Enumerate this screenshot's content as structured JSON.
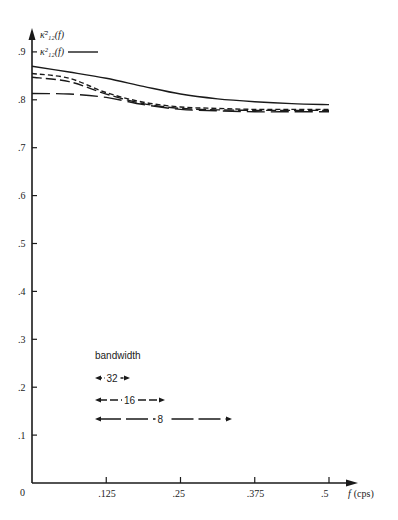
{
  "chart_data": {
    "type": "line",
    "title": "",
    "xlabel": "f (cps)",
    "ylabel": "",
    "xlim": [
      0,
      0.5
    ],
    "ylim": [
      0,
      0.9
    ],
    "grid": false,
    "x_ticks": [
      "0",
      ".125",
      ".25",
      ".375",
      ".5"
    ],
    "y_ticks": [
      ".1",
      ".2",
      ".3",
      ".4",
      ".5",
      ".6",
      ".7",
      ".8",
      ".9"
    ],
    "x": [
      0,
      0.0625,
      0.125,
      0.1875,
      0.25,
      0.3125,
      0.375,
      0.4375,
      0.5
    ],
    "legend": {
      "estimate_label": "κ̄²₁₂(f)",
      "true_label": "κ²₁₂(f)",
      "bandwidth_title": "bandwidth",
      "bandwidth_entries": [
        "32",
        "16",
        "8"
      ]
    },
    "series": [
      {
        "name": "κ²₁₂(f) (true)",
        "style": "solid",
        "values": [
          0.87,
          0.858,
          0.845,
          0.828,
          0.812,
          0.802,
          0.796,
          0.792,
          0.79
        ]
      },
      {
        "name": "κ̄²₁₂(f) bandwidth 32",
        "style": "short-dash",
        "values": [
          0.855,
          0.845,
          0.815,
          0.795,
          0.785,
          0.782,
          0.78,
          0.78,
          0.78
        ]
      },
      {
        "name": "κ̄²₁₂(f) bandwidth 16",
        "style": "medium-dash",
        "values": [
          0.847,
          0.838,
          0.812,
          0.792,
          0.782,
          0.779,
          0.778,
          0.778,
          0.778
        ]
      },
      {
        "name": "κ̄²₁₂(f) bandwidth 8",
        "style": "long-dash",
        "values": [
          0.813,
          0.812,
          0.805,
          0.79,
          0.78,
          0.777,
          0.775,
          0.775,
          0.775
        ]
      }
    ]
  },
  "axes": {
    "origin_label": "0",
    "x_label_f": "f",
    "x_label_unit": "(cps)"
  }
}
